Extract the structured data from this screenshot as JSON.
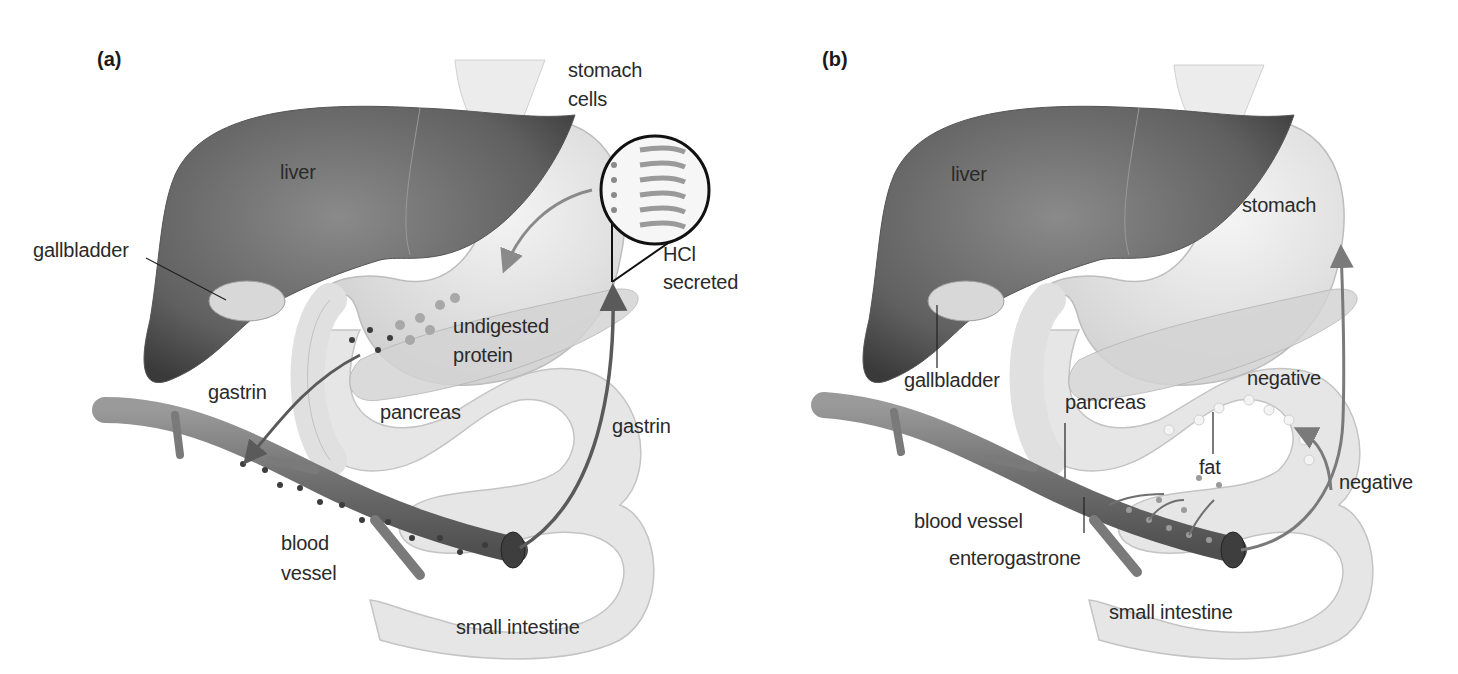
{
  "figure": {
    "panels": [
      {
        "id": "a",
        "panel_label": "(a)",
        "labels": {
          "stomach_cells": "stomach\ncells",
          "stomach_cells_line1": "stomach",
          "stomach_cells_line2": "cells",
          "liver": "liver",
          "gallbladder": "gallbladder",
          "hcl_line1": "HCl",
          "hcl_line2": "secreted",
          "undigested_line1": "undigested",
          "undigested_line2": "protein",
          "gastrin_left": "gastrin",
          "pancreas": "pancreas",
          "gastrin_right": "gastrin",
          "blood_line1": "blood",
          "blood_line2": "vessel",
          "small_intestine": "small intestine"
        }
      },
      {
        "id": "b",
        "panel_label": "(b)",
        "labels": {
          "liver": "liver",
          "stomach": "stomach",
          "gallbladder": "gallbladder",
          "negative_top": "negative",
          "pancreas": "pancreas",
          "fat": "fat",
          "negative_bottom": "negative",
          "blood_vessel": "blood vessel",
          "enterogastrone": "enterogastrone",
          "small_intestine": "small intestine"
        }
      }
    ],
    "colors": {
      "liver": "#6e6e6e",
      "liver_dark": "#3a3a3a",
      "stomach": "#dedede",
      "intestine": "#e4e4e4",
      "vessel": "#7a7a7a",
      "arrow": "#6a6a6a",
      "text": "#2a2a2a"
    }
  }
}
